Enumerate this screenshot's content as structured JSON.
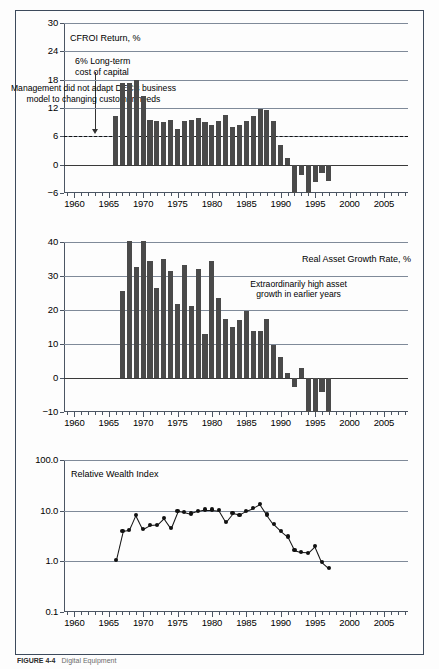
{
  "figure": {
    "caption_label": "FIGURE 4-4",
    "caption_text": "Digital Equipment"
  },
  "chart_data": [
    {
      "id": "cfroi",
      "type": "bar",
      "title": "CFROI Return, %",
      "xlabel": "",
      "ylabel": "CFROI Return, %",
      "ylim": [
        -6,
        30
      ],
      "yticks": [
        -6,
        0,
        6,
        12,
        18,
        24,
        30
      ],
      "ytick_labels": [
        "−6",
        "0",
        "6",
        "12",
        "18",
        "24",
        "30"
      ],
      "xlim": [
        1958.5,
        2008.5
      ],
      "xticks": [
        1960,
        1965,
        1970,
        1975,
        1980,
        1985,
        1990,
        1995,
        2000,
        2005
      ],
      "xtick_labels": [
        "1960",
        "1965",
        "1970",
        "1975",
        "1980",
        "1985",
        "1990",
        "1995",
        "2000",
        "2005"
      ],
      "grid": true,
      "reference_line": {
        "value": 6,
        "style": "dashed",
        "label": "6% Long-term cost of capital"
      },
      "annotations": [
        {
          "name": "cost-of-capital-note",
          "lines": [
            "6% Long-term",
            "cost of capital"
          ]
        },
        {
          "name": "management-note",
          "lines": [
            "Management did not adapt DEC's business",
            "model to changing customer needs"
          ]
        }
      ],
      "x": [
        1966,
        1967,
        1968,
        1969,
        1970,
        1971,
        1972,
        1973,
        1974,
        1975,
        1976,
        1977,
        1978,
        1979,
        1980,
        1981,
        1982,
        1983,
        1984,
        1985,
        1986,
        1987,
        1988,
        1989,
        1990,
        1991,
        1992,
        1993,
        1994,
        1995,
        1996,
        1997,
        1998
      ],
      "values": [
        10.4,
        17.2,
        17.2,
        18.0,
        14.6,
        9.4,
        9.2,
        9.0,
        9.4,
        7.5,
        9.2,
        9.4,
        9.8,
        9.1,
        8.3,
        9.2,
        10.6,
        8.0,
        8.3,
        9.2,
        10.3,
        11.8,
        11.5,
        9.2,
        4.2,
        1.4,
        -7.8,
        -2.2,
        -8.1,
        -3.6,
        -1.8,
        -3.4,
        0
      ]
    },
    {
      "id": "asset-growth",
      "type": "bar",
      "title": "Real Asset Growth Rate, %",
      "xlabel": "",
      "ylabel": "Real Asset Growth Rate, %",
      "ylim": [
        -10,
        40
      ],
      "yticks": [
        -10,
        0,
        10,
        20,
        30,
        40
      ],
      "ytick_labels": [
        "−10",
        "0",
        "10",
        "20",
        "30",
        "40"
      ],
      "xlim": [
        1958.5,
        2008.5
      ],
      "xticks": [
        1960,
        1965,
        1970,
        1975,
        1980,
        1985,
        1990,
        1995,
        2000,
        2005
      ],
      "xtick_labels": [
        "1960",
        "1965",
        "1970",
        "1975",
        "1980",
        "1985",
        "1990",
        "1995",
        "2000",
        "2005"
      ],
      "grid": true,
      "annotations": [
        {
          "name": "asset-growth-note",
          "lines": [
            "Extraordinarily high asset",
            "growth in earlier years"
          ]
        }
      ],
      "x": [
        1967,
        1968,
        1969,
        1970,
        1971,
        1972,
        1973,
        1974,
        1975,
        1976,
        1977,
        1978,
        1979,
        1980,
        1981,
        1982,
        1983,
        1984,
        1985,
        1986,
        1987,
        1988,
        1989,
        1990,
        1991,
        1992,
        1993,
        1994,
        1995,
        1996,
        1997
      ],
      "values": [
        25.6,
        40.4,
        32.6,
        40.3,
        34.4,
        26.5,
        34.9,
        31.4,
        21.8,
        33.2,
        21.1,
        32.1,
        13.0,
        34.4,
        23.5,
        17.3,
        15.0,
        17.0,
        19.8,
        13.8,
        13.9,
        17.3,
        9.8,
        6.2,
        1.4,
        -2.6,
        2.8,
        -13.0,
        -12.5,
        -4.2,
        -12.8
      ]
    },
    {
      "id": "relative-wealth",
      "type": "line",
      "title": "Relative Wealth Index",
      "xlabel": "",
      "ylabel": "Relative Wealth Index",
      "yscale": "log",
      "ylim": [
        0.1,
        100.0
      ],
      "yticks": [
        0.1,
        1.0,
        10.0,
        100.0
      ],
      "ytick_labels": [
        "0.1",
        "1.0",
        "10.0",
        "100.0"
      ],
      "xlim": [
        1958.5,
        2008.5
      ],
      "xticks": [
        1960,
        1965,
        1970,
        1975,
        1980,
        1985,
        1990,
        1995,
        2000,
        2005
      ],
      "xtick_labels": [
        "1960",
        "1965",
        "1970",
        "1975",
        "1980",
        "1985",
        "1990",
        "1995",
        "2000",
        "2005"
      ],
      "grid": true,
      "markers": true,
      "x": [
        1966,
        1967,
        1968,
        1969,
        1970,
        1971,
        1972,
        1973,
        1974,
        1975,
        1976,
        1977,
        1978,
        1979,
        1980,
        1981,
        1982,
        1983,
        1984,
        1985,
        1986,
        1987,
        1988,
        1989,
        1990,
        1991,
        1992,
        1993,
        1994,
        1995,
        1996,
        1997
      ],
      "values": [
        1.05,
        3.9,
        4.1,
        8.3,
        4.4,
        5.2,
        5.3,
        7.2,
        4.6,
        9.9,
        9.5,
        8.8,
        9.8,
        10.5,
        10.5,
        10.2,
        6.0,
        8.9,
        8.3,
        10.0,
        11.3,
        13.5,
        8.4,
        5.4,
        4.0,
        3.1,
        1.65,
        1.5,
        1.48,
        2.0,
        0.97,
        0.73
      ]
    }
  ]
}
